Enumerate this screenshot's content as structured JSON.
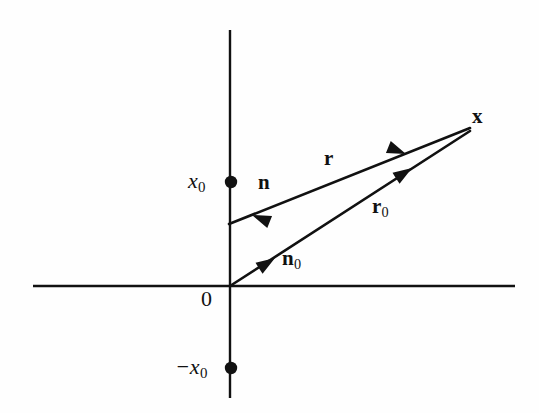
{
  "figure": {
    "type": "line-diagram",
    "background_color": "#fefefe",
    "ink_color": "#111111",
    "width": 539,
    "height": 413
  },
  "axes": {
    "vertical": {
      "name": "vertical-axis",
      "x": 230,
      "y_top": 30,
      "y_bottom": 398,
      "stroke_width": 2.4
    },
    "horizontal": {
      "name": "horizontal-axis",
      "y": 286,
      "x_left": 33,
      "x_right": 515,
      "stroke_width": 2.4
    },
    "origin": {
      "x": 230,
      "y": 286
    }
  },
  "points": [
    {
      "id": "source-upper",
      "label_main": "x",
      "label_sub": "0",
      "label_prefix": "",
      "style": "italic",
      "dot": {
        "x": 231,
        "y": 182,
        "r": 6.2
      },
      "label_pos": {
        "x": 188,
        "y": 170
      }
    },
    {
      "id": "source-lower",
      "label_main": "x",
      "label_sub": "0",
      "label_prefix": "−",
      "style": "italic",
      "dot": {
        "x": 231,
        "y": 368,
        "r": 6.2
      },
      "label_pos": {
        "x": 175,
        "y": 356
      }
    },
    {
      "id": "origin",
      "label_main": "0",
      "label_sub": "",
      "label_prefix": "",
      "style": "upright",
      "dot": null,
      "label_pos": {
        "x": 201,
        "y": 288
      }
    },
    {
      "id": "field-point",
      "label_main": "x",
      "label_sub": "",
      "label_prefix": "",
      "style": "bold",
      "dot": null,
      "label_pos": {
        "x": 472,
        "y": 106
      }
    }
  ],
  "vectors": [
    {
      "id": "r",
      "label_main": "r",
      "label_sub": "",
      "from": {
        "x": 229,
        "y": 224
      },
      "to": {
        "x": 470,
        "y": 128
      },
      "label_pos": {
        "x": 324,
        "y": 148
      },
      "direction_label": {
        "main": "n",
        "sub": "",
        "x": 258,
        "y": 172
      },
      "arrow_tail_head": {
        "x": 252,
        "y": 215,
        "angle": 201.7
      },
      "arrow_mid_head": {
        "x": 406,
        "y": 154,
        "angle": 21.7
      }
    },
    {
      "id": "r0",
      "label_main": "r",
      "label_sub": "0",
      "from": {
        "x": 230,
        "y": 286
      },
      "to": {
        "x": 470,
        "y": 131
      },
      "label_pos": {
        "x": 372,
        "y": 196
      },
      "direction_label": {
        "main": "n",
        "sub": "0",
        "x": 282,
        "y": 248
      },
      "arrow_tail_head": {
        "x": 275,
        "y": 258,
        "angle": 327.1
      },
      "arrow_mid_head": {
        "x": 412,
        "y": 168,
        "angle": 327.1
      }
    }
  ]
}
